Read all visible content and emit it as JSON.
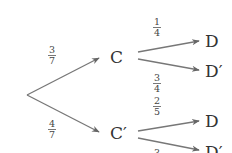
{
  "diagram": {
    "type": "probability-tree",
    "root": {
      "x": 27,
      "y": 95
    },
    "level1": [
      {
        "label": "C",
        "prime": false,
        "prob_num": "3",
        "prob_den": "7",
        "edge": {
          "x1": 27,
          "y1": 95,
          "x2": 99,
          "y2": 58
        },
        "label_pos": {
          "x": 111,
          "y": 63
        },
        "frac_pos": {
          "x": 52,
          "y": 55
        }
      },
      {
        "label": "C′",
        "prime": true,
        "prob_num": "4",
        "prob_den": "7",
        "edge": {
          "x1": 27,
          "y1": 95,
          "x2": 99,
          "y2": 132
        },
        "label_pos": {
          "x": 111,
          "y": 139
        },
        "frac_pos": {
          "x": 52,
          "y": 130
        }
      }
    ],
    "level2": [
      {
        "parent": "C",
        "label": "D",
        "prob_num": "1",
        "prob_den": "4",
        "edge": {
          "x1": 138,
          "y1": 52,
          "x2": 199,
          "y2": 41
        },
        "label_pos": {
          "x": 205,
          "y": 47
        },
        "frac_pos": {
          "x": 157,
          "y": 28
        }
      },
      {
        "parent": "C",
        "label": "D′",
        "prob_num": "3",
        "prob_den": "4",
        "edge": {
          "x1": 138,
          "y1": 59,
          "x2": 199,
          "y2": 70
        },
        "label_pos": {
          "x": 205,
          "y": 77
        },
        "frac_pos": {
          "x": 157,
          "y": 84
        }
      },
      {
        "parent": "C′",
        "label": "D",
        "prob_num": "2",
        "prob_den": "5",
        "edge": {
          "x1": 138,
          "y1": 131,
          "x2": 199,
          "y2": 121
        },
        "label_pos": {
          "x": 205,
          "y": 127
        },
        "frac_pos": {
          "x": 157,
          "y": 106
        }
      },
      {
        "parent": "C′",
        "label": "D′",
        "prob_num": "3",
        "prob_den": "",
        "edge": {
          "x1": 138,
          "y1": 138,
          "x2": 199,
          "y2": 150
        },
        "label_pos": {
          "x": 205,
          "y": 158
        },
        "frac_pos": {
          "x": 157,
          "y": 156
        }
      }
    ]
  }
}
